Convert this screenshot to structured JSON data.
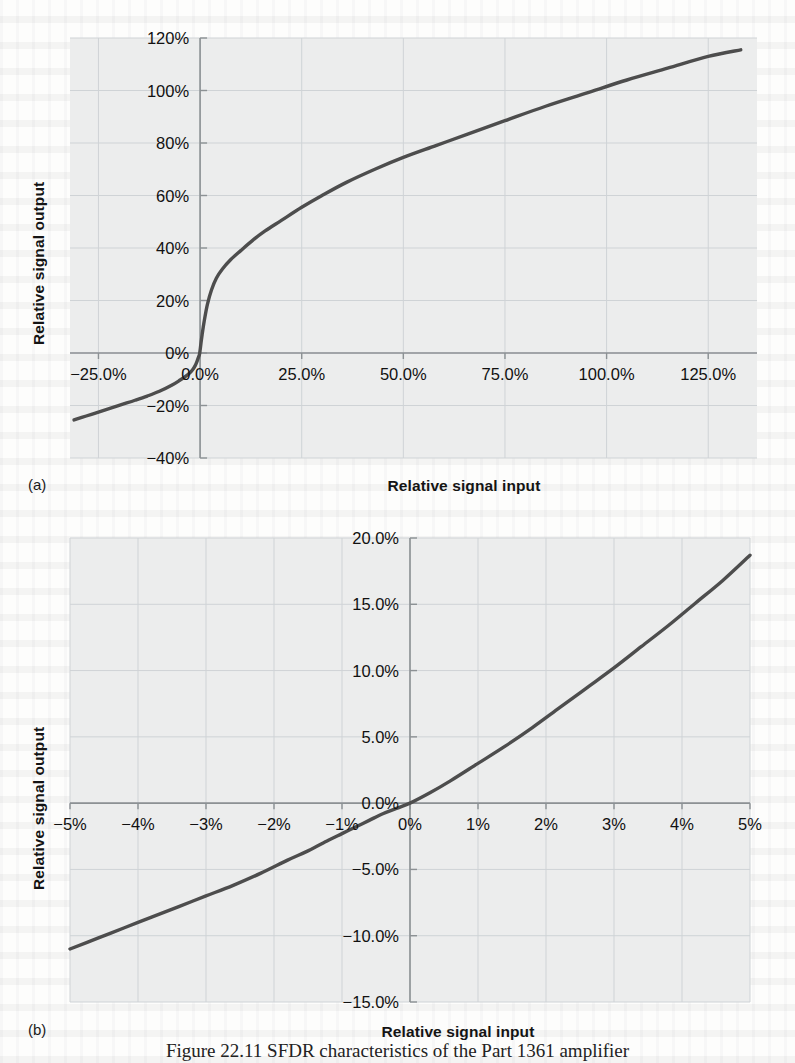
{
  "figure": {
    "caption": "Figure 22.11   SFDR characteristics of the Part 1361 amplifier",
    "panels": [
      {
        "key": "a",
        "label": "(a)"
      },
      {
        "key": "b",
        "label": "(b)"
      }
    ]
  },
  "chart_data": [
    {
      "type": "line",
      "panel": "(a)",
      "title": "",
      "xlabel": "Relative signal input",
      "ylabel": "Relative signal output",
      "xlim": [
        -32,
        137
      ],
      "ylim": [
        -40,
        120
      ],
      "grid": true,
      "legend": "none",
      "xticks": [
        "-25.0%",
        "0.0%",
        "25.0%",
        "50.0%",
        "75.0%",
        "100.0%",
        "125.0%"
      ],
      "xtickvalues": [
        -25,
        0,
        25,
        50,
        75,
        100,
        125
      ],
      "yticks": [
        "-40%",
        "-20%",
        "0%",
        "20%",
        "40%",
        "60%",
        "80%",
        "100%",
        "120%"
      ],
      "ytickvalues": [
        -40,
        -20,
        0,
        20,
        40,
        60,
        80,
        100,
        120
      ],
      "x": [
        -31,
        -28,
        -25,
        -22,
        -19,
        -16,
        -13,
        -10,
        -7,
        -5,
        -3.5,
        -2.5,
        -1.8,
        -1.2,
        -0.8,
        -0.4,
        -0.15,
        0,
        0.2,
        0.5,
        1,
        1.8,
        2.8,
        4,
        5.5,
        7.5,
        10,
        13,
        16,
        20,
        25,
        30,
        36,
        43,
        50,
        58,
        66,
        75,
        85,
        95,
        105,
        115,
        125,
        133
      ],
      "y": [
        -25.5,
        -24.0,
        -22.5,
        -21.0,
        -19.5,
        -18.0,
        -16.4,
        -14.6,
        -12.3,
        -10.4,
        -8.8,
        -7.5,
        -6.3,
        -4.8,
        -3.4,
        -1.6,
        -0.5,
        1.0,
        3.5,
        7.0,
        12.0,
        18.5,
        24.0,
        28.5,
        32.0,
        35.5,
        39.0,
        43.0,
        46.5,
        50.5,
        55.5,
        60.0,
        65.0,
        70.0,
        74.5,
        79.0,
        83.5,
        88.5,
        94.0,
        99.0,
        104.0,
        108.5,
        113.0,
        115.5
      ]
    },
    {
      "type": "line",
      "panel": "(b)",
      "title": "",
      "xlabel": "Relative signal input",
      "ylabel": "Relative signal output",
      "xlim": [
        -5,
        5
      ],
      "ylim": [
        -15,
        20
      ],
      "grid": true,
      "legend": "none",
      "xticks": [
        "-5%",
        "-4%",
        "-3%",
        "-2%",
        "-1%",
        "0%",
        "1%",
        "2%",
        "3%",
        "4%",
        "5%"
      ],
      "xtickvalues": [
        -5,
        -4,
        -3,
        -2,
        -1,
        0,
        1,
        2,
        3,
        4,
        5
      ],
      "yticks": [
        "-15.0%",
        "-10.0%",
        "-5.0%",
        "0.0%",
        "5.0%",
        "10.0%",
        "15.0%",
        "20.0%"
      ],
      "ytickvalues": [
        -15,
        -10,
        -5,
        0,
        5,
        10,
        15,
        20
      ],
      "x": [
        -5,
        -4.6,
        -4.2,
        -3.8,
        -3.4,
        -3,
        -2.6,
        -2.2,
        -1.8,
        -1.5,
        -1.2,
        -1,
        -0.8,
        -0.6,
        -0.4,
        -0.2,
        0,
        0.3,
        0.6,
        1,
        1.4,
        1.8,
        2.2,
        2.6,
        3,
        3.4,
        3.8,
        4.2,
        4.6,
        5
      ],
      "y": [
        -11.0,
        -10.2,
        -9.4,
        -8.6,
        -7.8,
        -7.0,
        -6.2,
        -5.3,
        -4.3,
        -3.6,
        -2.8,
        -2.3,
        -1.8,
        -1.3,
        -0.8,
        -0.4,
        0.0,
        0.8,
        1.7,
        3.0,
        4.3,
        5.7,
        7.2,
        8.7,
        10.2,
        11.8,
        13.4,
        15.1,
        16.8,
        18.7
      ]
    }
  ],
  "style": {
    "plot_background": "#eceded",
    "grid_color": "#cfd3d6",
    "axis_color": "#8c9194",
    "curve_color": "#4d4d4d",
    "text_color": "#111111"
  }
}
